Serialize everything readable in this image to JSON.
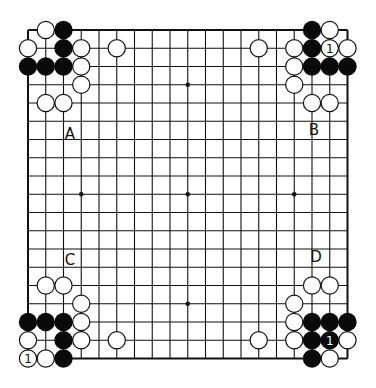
{
  "board": {
    "size": 19,
    "origin_x": 28,
    "origin_y": 30,
    "spacing_x": 17.75,
    "spacing_y": 18.25,
    "line_color": "#111111",
    "stone_radius": 8.6,
    "star_points": [
      [
        9,
        3
      ],
      [
        3,
        9
      ],
      [
        9,
        9
      ],
      [
        15,
        9
      ],
      [
        9,
        15
      ]
    ],
    "stones": {
      "black": [
        [
          2,
          0
        ],
        [
          2,
          1
        ],
        [
          0,
          2
        ],
        [
          1,
          2
        ],
        [
          2,
          2
        ],
        [
          16,
          0
        ],
        [
          16,
          1
        ],
        [
          16,
          2
        ],
        [
          17,
          2
        ],
        [
          18,
          2
        ],
        [
          0,
          16
        ],
        [
          1,
          16
        ],
        [
          2,
          16
        ],
        [
          2,
          17
        ],
        [
          2,
          18
        ],
        [
          16,
          16
        ],
        [
          17,
          16
        ],
        [
          18,
          16
        ],
        [
          16,
          17
        ],
        [
          17,
          17
        ],
        [
          16,
          18
        ]
      ],
      "white": [
        [
          1,
          0
        ],
        [
          0,
          1
        ],
        [
          3,
          1
        ],
        [
          5,
          1
        ],
        [
          3,
          2
        ],
        [
          3,
          3
        ],
        [
          1,
          4
        ],
        [
          2,
          4
        ],
        [
          17,
          0
        ],
        [
          13,
          1
        ],
        [
          15,
          1
        ],
        [
          17,
          1
        ],
        [
          18,
          1
        ],
        [
          15,
          2
        ],
        [
          15,
          3
        ],
        [
          16,
          4
        ],
        [
          17,
          4
        ],
        [
          1,
          14
        ],
        [
          2,
          14
        ],
        [
          3,
          15
        ],
        [
          3,
          16
        ],
        [
          0,
          17
        ],
        [
          3,
          17
        ],
        [
          5,
          17
        ],
        [
          0,
          18
        ],
        [
          1,
          18
        ],
        [
          16,
          14
        ],
        [
          17,
          14
        ],
        [
          15,
          15
        ],
        [
          15,
          16
        ],
        [
          13,
          17
        ],
        [
          15,
          17
        ],
        [
          18,
          17
        ],
        [
          17,
          18
        ]
      ]
    },
    "marked_stones": [
      {
        "col": 17,
        "row": 1,
        "color": "white",
        "mark": "1"
      },
      {
        "col": 0,
        "row": 18,
        "color": "white",
        "mark": "1"
      },
      {
        "col": 17,
        "row": 17,
        "color": "black",
        "mark": "1"
      }
    ]
  },
  "labels": [
    {
      "id": "A",
      "text": "A",
      "x": 70,
      "y": 134
    },
    {
      "id": "B",
      "text": "B",
      "x": 314,
      "y": 130
    },
    {
      "id": "C",
      "text": "C",
      "x": 70,
      "y": 260
    },
    {
      "id": "D",
      "text": "D",
      "x": 316,
      "y": 257
    }
  ]
}
